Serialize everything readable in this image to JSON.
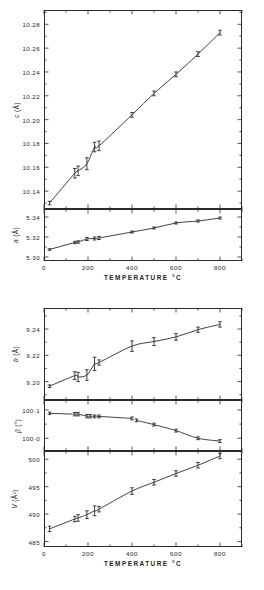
{
  "figure": {
    "xlabel": "TEMPERATURE   °C",
    "xticks": [
      "0",
      "200",
      "400",
      "600",
      "800"
    ],
    "xlim": [
      0,
      900
    ]
  },
  "chart_data": [
    {
      "type": "scatter",
      "id": "c-axis",
      "title": "",
      "ylabel": "c  (Å)",
      "ylabel_symbol": "c",
      "ylabel_unit": "(Å)",
      "xlabel": "TEMPERATURE   °C",
      "xlim": [
        0,
        900
      ],
      "ylim": [
        10.125,
        10.292
      ],
      "yticks": [
        10.14,
        10.16,
        10.18,
        10.2,
        10.22,
        10.24,
        10.26,
        10.28
      ],
      "ytick_labels": [
        "10.14",
        "10.16",
        "10.18",
        "10.20",
        "10.22",
        "10.24",
        "10.26",
        "10.28"
      ],
      "grid": false,
      "legend": null,
      "x": [
        25,
        140,
        155,
        195,
        230,
        250,
        400,
        500,
        600,
        700,
        800
      ],
      "y": [
        10.13,
        10.155,
        10.157,
        10.163,
        10.177,
        10.178,
        10.204,
        10.222,
        10.238,
        10.255,
        10.273
      ],
      "yerr": [
        0.0015,
        0.004,
        0.004,
        0.005,
        0.004,
        0.004,
        0.002,
        0.002,
        0.002,
        0.002,
        0.002
      ]
    },
    {
      "type": "scatter",
      "id": "a-axis",
      "ylabel": "a  (Å)",
      "ylabel_symbol": "a",
      "ylabel_unit": "(Å)",
      "xlim": [
        0,
        900
      ],
      "ylim": [
        5.296,
        5.348
      ],
      "yticks": [
        5.3,
        5.32,
        5.34
      ],
      "ytick_labels": [
        "5.30",
        "5.32",
        "5.34"
      ],
      "grid": false,
      "x": [
        25,
        140,
        155,
        195,
        230,
        250,
        400,
        500,
        600,
        700,
        800
      ],
      "y": [
        5.3075,
        5.3145,
        5.315,
        5.318,
        5.3185,
        5.319,
        5.325,
        5.329,
        5.334,
        5.336,
        5.339
      ],
      "yerr": [
        0.0008,
        0.0012,
        0.0012,
        0.0015,
        0.0015,
        0.0015,
        0.001,
        0.001,
        0.001,
        0.001,
        0.001
      ]
    },
    {
      "type": "scatter",
      "id": "b-axis",
      "ylabel": "b  (Å)",
      "ylabel_symbol": "b",
      "ylabel_unit": "(Å)",
      "xlim": [
        0,
        900
      ],
      "ylim": [
        9.186,
        9.256
      ],
      "yticks": [
        9.2,
        9.22,
        9.24
      ],
      "ytick_labels": [
        "9.20",
        "9.22",
        "9.24"
      ],
      "grid": false,
      "x": [
        25,
        140,
        155,
        195,
        230,
        250,
        400,
        500,
        600,
        700,
        800
      ],
      "y": [
        9.1965,
        9.2045,
        9.2035,
        9.205,
        9.2135,
        9.2145,
        9.227,
        9.2305,
        9.234,
        9.2395,
        9.2435
      ],
      "yerr": [
        0.001,
        0.003,
        0.0035,
        0.004,
        0.005,
        0.002,
        0.004,
        0.003,
        0.0025,
        0.002,
        0.002
      ]
    },
    {
      "type": "scatter",
      "id": "beta-angle",
      "ylabel": "β  (°)",
      "ylabel_symbol": "β",
      "ylabel_unit": "(°)",
      "xlim": [
        0,
        900
      ],
      "ylim": [
        99.955,
        100.135
      ],
      "yticks": [
        100.0,
        100.1
      ],
      "ytick_labels": [
        "100·0",
        "100·1"
      ],
      "grid": false,
      "x": [
        25,
        140,
        155,
        195,
        210,
        230,
        250,
        400,
        420,
        500,
        600,
        700,
        800
      ],
      "y": [
        100.088,
        100.085,
        100.085,
        100.078,
        100.078,
        100.077,
        100.077,
        100.07,
        100.063,
        100.048,
        100.027,
        100.0,
        99.99
      ],
      "yerr": [
        0.004,
        0.006,
        0.006,
        0.006,
        0.006,
        0.005,
        0.005,
        0.005,
        0.005,
        0.005,
        0.005,
        0.005,
        0.005
      ]
    },
    {
      "type": "scatter",
      "id": "cell-volume",
      "ylabel": "V  (Å³)",
      "ylabel_symbol": "V",
      "ylabel_unit": "(Å³)",
      "xlabel": "TEMPERATURE   °C",
      "xlim": [
        0,
        900
      ],
      "ylim": [
        484.0,
        501.5
      ],
      "yticks": [
        485,
        490,
        495,
        500
      ],
      "ytick_labels": [
        "485",
        "490",
        "495",
        "500"
      ],
      "grid": false,
      "x": [
        25,
        140,
        155,
        195,
        230,
        250,
        400,
        500,
        600,
        700,
        800
      ],
      "y": [
        487.3,
        489.1,
        489.3,
        489.9,
        490.6,
        490.9,
        494.2,
        495.8,
        497.4,
        498.9,
        500.6
      ],
      "yerr": [
        0.5,
        0.5,
        0.6,
        0.7,
        0.9,
        0.5,
        0.6,
        0.5,
        0.5,
        0.5,
        0.5
      ]
    }
  ]
}
